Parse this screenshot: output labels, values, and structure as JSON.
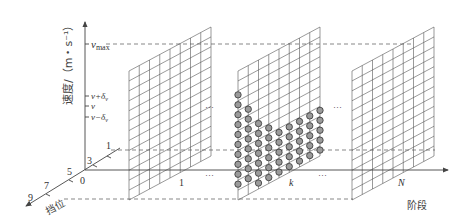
{
  "diagram": {
    "y_axis": {
      "label": "速度/（m・s⁻¹）",
      "ticks": [
        "v_max",
        "v+δ_v",
        "v",
        "v−δ_v"
      ],
      "tick_display": {
        "vmax_base": "v",
        "vmax_sub": "max",
        "vplus": "v+δ",
        "vplus_sub": "v",
        "v": "v",
        "vminus": "v−δ",
        "vminus_sub": "v"
      }
    },
    "x_axis": {
      "label": "阶段",
      "ticks": [
        "0",
        "1",
        "k",
        "N"
      ],
      "ellipsis": "···"
    },
    "gear_axis": {
      "label": "挡位",
      "ticks": [
        "1",
        "3",
        "5",
        "7",
        "9"
      ]
    },
    "grids": [
      {
        "name": "stage-1",
        "stage_label": "1",
        "columns": 8,
        "rows": 13
      },
      {
        "name": "stage-k",
        "stage_label": "k",
        "columns": 8,
        "rows": 13,
        "has_state_points": true
      },
      {
        "name": "stage-N",
        "stage_label": "N",
        "columns": 8,
        "rows": 13
      }
    ],
    "colors": {
      "line": "#555555",
      "dot_fill": "#9a9a9a",
      "dot_stroke": "#333333"
    }
  }
}
